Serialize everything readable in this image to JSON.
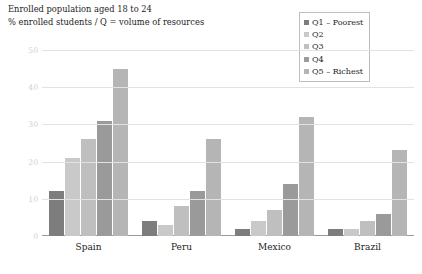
{
  "titles": {
    "line1": "Enrolled population aged 18 to 24",
    "line2": "% enrolled students / Q = volume of resources"
  },
  "legend": {
    "items": [
      {
        "label": "Q1 – Poorest",
        "color": "#7d7d7d"
      },
      {
        "label": "Q2",
        "color": "#c9c9c9"
      },
      {
        "label": "Q3",
        "color": "#bfbfbf"
      },
      {
        "label": "Q4",
        "color": "#9a9a9a"
      },
      {
        "label": "Q5 – Richest",
        "color": "#b5b5b5"
      }
    ]
  },
  "chart_data": {
    "type": "bar",
    "title": "Enrolled population aged 18 to 24",
    "subtitle": "% enrolled students / Q = volume of resources",
    "xlabel": "",
    "ylabel": "",
    "ylim": [
      0,
      50
    ],
    "yticks": [
      0,
      10,
      20,
      30,
      40,
      50
    ],
    "ytick_labels": [
      "0",
      "10",
      "20",
      "30",
      "40",
      "50"
    ],
    "grid": true,
    "legend_position": "top-right",
    "categories": [
      "Spain",
      "Peru",
      "Mexico",
      "Brazil"
    ],
    "series": [
      {
        "name": "Q1 – Poorest",
        "color": "#7d7d7d",
        "values": [
          12,
          4,
          2,
          2
        ]
      },
      {
        "name": "Q2",
        "color": "#c9c9c9",
        "values": [
          21,
          3,
          4,
          2
        ]
      },
      {
        "name": "Q3",
        "color": "#bfbfbf",
        "values": [
          26,
          8,
          7,
          4
        ]
      },
      {
        "name": "Q4",
        "color": "#9a9a9a",
        "values": [
          31,
          12,
          14,
          6
        ]
      },
      {
        "name": "Q5 – Richest",
        "color": "#b5b5b5",
        "values": [
          45,
          26,
          32,
          23
        ]
      }
    ]
  }
}
